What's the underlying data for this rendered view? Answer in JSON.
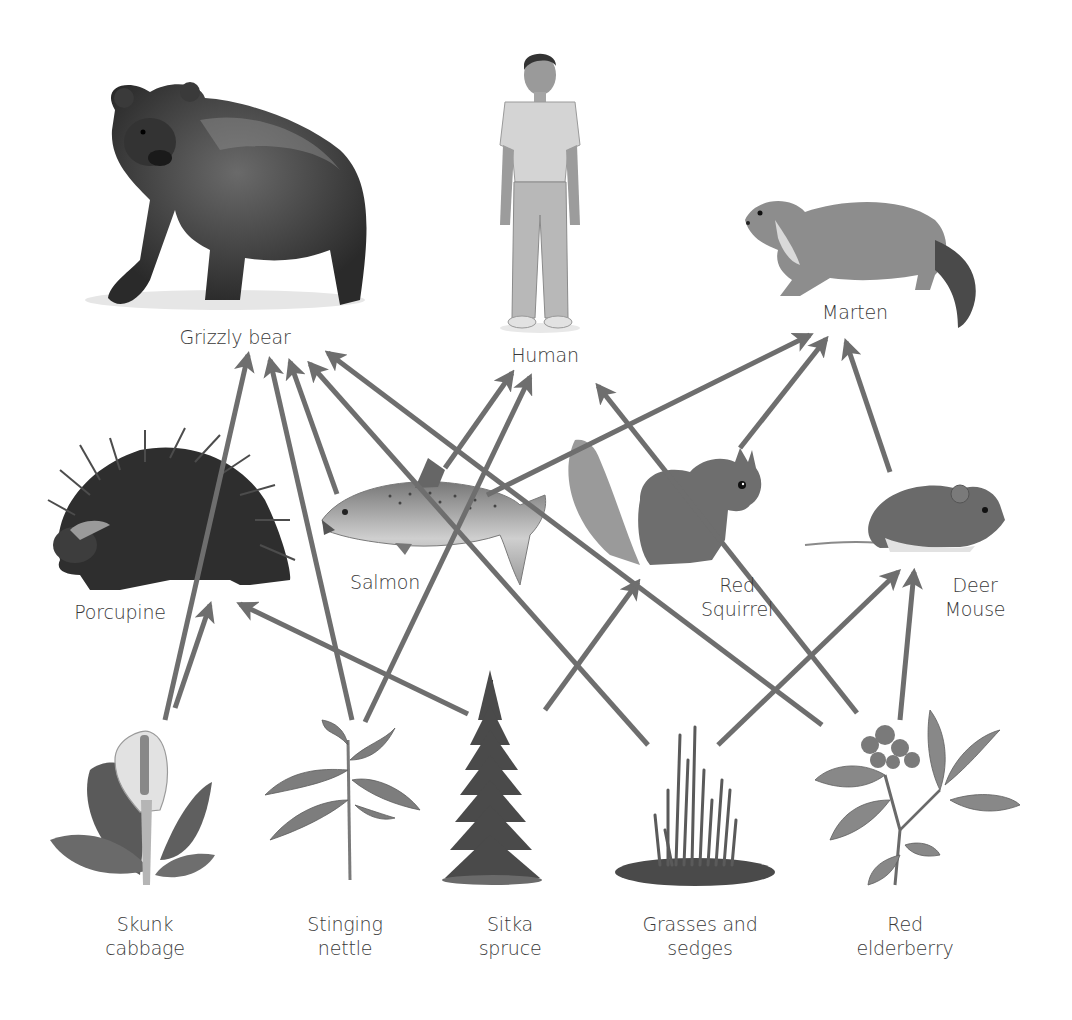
{
  "diagram": {
    "type": "food-web",
    "arrow_color": "#6e6e6e",
    "organisms": [
      {
        "id": "grizzly_bear",
        "label_lines": [
          "Grizzly bear"
        ],
        "level": "top"
      },
      {
        "id": "human",
        "label_lines": [
          "Human"
        ],
        "level": "top"
      },
      {
        "id": "marten",
        "label_lines": [
          "Marten"
        ],
        "level": "top"
      },
      {
        "id": "porcupine",
        "label_lines": [
          "Porcupine"
        ],
        "level": "middle"
      },
      {
        "id": "salmon",
        "label_lines": [
          "Salmon"
        ],
        "level": "middle"
      },
      {
        "id": "red_squirrel",
        "label_lines": [
          "Red",
          "Squirrel"
        ],
        "level": "middle"
      },
      {
        "id": "deer_mouse",
        "label_lines": [
          "Deer",
          "Mouse"
        ],
        "level": "middle"
      },
      {
        "id": "skunk_cabbage",
        "label_lines": [
          "Skunk",
          "cabbage"
        ],
        "level": "producer"
      },
      {
        "id": "stinging_nettle",
        "label_lines": [
          "Stinging",
          "nettle"
        ],
        "level": "producer"
      },
      {
        "id": "sitka_spruce",
        "label_lines": [
          "Sitka",
          "spruce"
        ],
        "level": "producer"
      },
      {
        "id": "grasses_sedges",
        "label_lines": [
          "Grasses and",
          "sedges"
        ],
        "level": "producer"
      },
      {
        "id": "red_elderberry",
        "label_lines": [
          "Red",
          "elderberry"
        ],
        "level": "producer"
      }
    ],
    "edges": [
      {
        "from": "skunk_cabbage",
        "to": "grizzly_bear"
      },
      {
        "from": "skunk_cabbage",
        "to": "porcupine"
      },
      {
        "from": "stinging_nettle",
        "to": "grizzly_bear"
      },
      {
        "from": "stinging_nettle",
        "to": "human"
      },
      {
        "from": "salmon",
        "to": "grizzly_bear"
      },
      {
        "from": "salmon",
        "to": "human"
      },
      {
        "from": "salmon",
        "to": "marten"
      },
      {
        "from": "sitka_spruce",
        "to": "porcupine"
      },
      {
        "from": "sitka_spruce",
        "to": "red_squirrel"
      },
      {
        "from": "grasses_sedges",
        "to": "grizzly_bear"
      },
      {
        "from": "grasses_sedges",
        "to": "deer_mouse"
      },
      {
        "from": "red_elderberry",
        "to": "grizzly_bear"
      },
      {
        "from": "red_elderberry",
        "to": "human"
      },
      {
        "from": "red_elderberry",
        "to": "deer_mouse"
      },
      {
        "from": "red_squirrel",
        "to": "marten"
      },
      {
        "from": "deer_mouse",
        "to": "marten"
      }
    ]
  },
  "labels": {
    "grizzly_bear": {
      "l1": "Grizzly bear"
    },
    "human": {
      "l1": "Human"
    },
    "marten": {
      "l1": "Marten"
    },
    "porcupine": {
      "l1": "Porcupine"
    },
    "salmon": {
      "l1": "Salmon"
    },
    "red_squirrel": {
      "l1": "Red",
      "l2": "Squirrel"
    },
    "deer_mouse": {
      "l1": "Deer",
      "l2": "Mouse"
    },
    "skunk_cabbage": {
      "l1": "Skunk",
      "l2": "cabbage"
    },
    "stinging_nettle": {
      "l1": "Stinging",
      "l2": "nettle"
    },
    "sitka_spruce": {
      "l1": "Sitka",
      "l2": "spruce"
    },
    "grasses_sedges": {
      "l1": "Grasses and",
      "l2": "sedges"
    },
    "red_elderberry": {
      "l1": "Red",
      "l2": "elderberry"
    }
  }
}
